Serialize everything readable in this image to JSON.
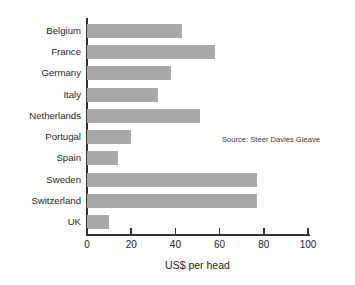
{
  "chart_data": {
    "type": "bar",
    "orientation": "horizontal",
    "title": "",
    "xlabel": "US$ per head",
    "ylabel": "",
    "xlim": [
      0,
      100
    ],
    "xticks": [
      0,
      20,
      40,
      60,
      80,
      100
    ],
    "grid": false,
    "legend": null,
    "bar_color": "#a9a9a9",
    "axis_color": "#33332f",
    "background": "#ffffff",
    "annotation": "Source: Steer Davies Gleave",
    "categories": [
      "Belgium",
      "France",
      "Germany",
      "Italy",
      "Netherlands",
      "Portugal",
      "Spain",
      "Sweden",
      "Switzerland",
      "UK"
    ],
    "values": [
      43,
      58,
      38,
      32,
      51,
      20,
      14,
      77,
      77,
      10
    ],
    "points": [
      {
        "category": "Belgium",
        "value": 43
      },
      {
        "category": "France",
        "value": 58
      },
      {
        "category": "Germany",
        "value": 38
      },
      {
        "category": "Italy",
        "value": 32
      },
      {
        "category": "Netherlands",
        "value": 51
      },
      {
        "category": "Portugal",
        "value": 20
      },
      {
        "category": "Spain",
        "value": 14
      },
      {
        "category": "Sweden",
        "value": 77
      },
      {
        "category": "Switzerland",
        "value": 77
      },
      {
        "category": "UK",
        "value": 10
      }
    ]
  }
}
